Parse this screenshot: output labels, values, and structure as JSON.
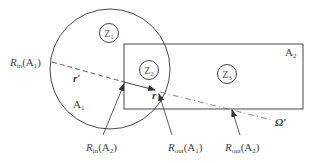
{
  "diagram": {
    "regions": [
      {
        "id": "A1",
        "shape": "circle",
        "label": "A",
        "sub": "1"
      },
      {
        "id": "A2",
        "shape": "rectangle",
        "label": "A",
        "sub": "2"
      }
    ],
    "zones": [
      {
        "id": "Z1",
        "label": "Z",
        "sub": "1"
      },
      {
        "id": "Z2",
        "label": "Z",
        "sub": "2"
      },
      {
        "id": "Z3",
        "label": "Z",
        "sub": "3"
      }
    ],
    "vectors": {
      "r_prime": "r′",
      "r": "r",
      "omega_prime": "Ω′"
    },
    "boundary_labels": {
      "rin_a1": {
        "R": "R",
        "sub": "in",
        "arg": "(A",
        "argsub": "1",
        "close": ")"
      },
      "rin_a2": {
        "R": "R",
        "sub": "in",
        "arg": "(A",
        "argsub": "2",
        "close": ")"
      },
      "rout_a1": {
        "R": "R",
        "sub": "out",
        "arg": "(A",
        "argsub": "1",
        "close": ")"
      },
      "rout_a2": {
        "R": "R",
        "sub": "out",
        "arg": "(A",
        "argsub": "2",
        "close": ")"
      }
    },
    "colors": {
      "stroke": "#333333",
      "text": "#444444"
    }
  }
}
